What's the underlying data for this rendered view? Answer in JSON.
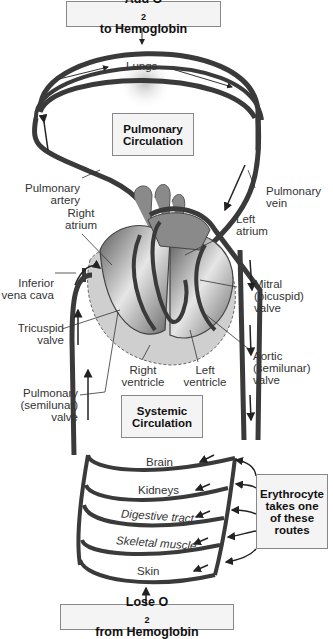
{
  "top_box": {
    "prefix": "Add O",
    "sub": "2",
    "suffix": " to Hemoglobin"
  },
  "bottom_box": {
    "prefix": "Lose O",
    "sub": "2",
    "suffix": " from Hemoglobin"
  },
  "lungs_label": "Lungs",
  "pulmonary_box": {
    "line1": "Pulmonary",
    "line2": "Circulation"
  },
  "systemic_box": {
    "line1": "Systemic",
    "line2": "Circulation"
  },
  "erythrocyte_box": {
    "line1": "Erythrocyte",
    "line2": "takes one",
    "line3": "of these",
    "line4": "routes"
  },
  "heart_labels": {
    "pulmonary_artery": {
      "line1": "Pulmonary",
      "line2": "artery"
    },
    "right_atrium": {
      "line1": "Right",
      "line2": "atrium"
    },
    "inferior_vena_cava": {
      "line1": "Inferior",
      "line2": "vena cava"
    },
    "tricuspid_valve": {
      "line1": "Tricuspid",
      "line2": "valve"
    },
    "pulmonary_semilunar_valve": {
      "line1": "Pulmonary",
      "line2": "(semilunar)",
      "line3": "valve"
    },
    "right_ventricle": {
      "line1": "Right",
      "line2": "ventricle"
    },
    "left_ventricle": {
      "line1": "Left",
      "line2": "ventricle"
    },
    "pulmonary_vein": {
      "line1": "Pulmonary",
      "line2": "vein"
    },
    "left_atrium": {
      "line1": "Left",
      "line2": "atrium"
    },
    "mitral_valve": {
      "line1": "Mitral",
      "line2": "(bicuspid)",
      "line3": "valve"
    },
    "aortic_valve": {
      "line1": "Aortic",
      "line2": "(semilunar)",
      "line3": "valve"
    }
  },
  "organ_routes": [
    "Brain",
    "Kidneys",
    "Digestive tract",
    "Skeletal muscle",
    "Skin"
  ],
  "colors": {
    "vessel": "#3a3a3a",
    "heart_dark": "#555555",
    "heart_mid": "#8a8a8a",
    "heart_light": "#c8c8c8",
    "box_bg": "#f4f4f4"
  }
}
